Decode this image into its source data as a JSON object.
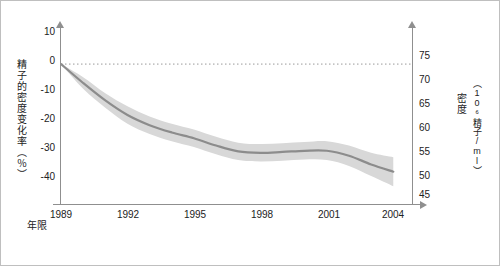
{
  "chart_data": {
    "type": "line",
    "title": "",
    "xlabel": "年限",
    "ylabel_left": "精子的密度变化率（％）",
    "ylabel_right": "密度",
    "ylabel_right_unit": "（10⁶精子/ml）",
    "x": [
      1989,
      1990,
      1991,
      1992,
      1993,
      1994,
      1995,
      1996,
      1997,
      1998,
      1999,
      2000,
      2001,
      2002,
      2003,
      2004
    ],
    "xticks": [
      "1989",
      "1992",
      "1995",
      "1998",
      "2001",
      "2004"
    ],
    "xlim": [
      1989,
      2004.8
    ],
    "yticks_left": [
      "10",
      "0",
      "-10",
      "-20",
      "-30",
      "-40"
    ],
    "ylim_left": [
      -45,
      10
    ],
    "yticks_right": [
      "75",
      "70",
      "65",
      "60",
      "55",
      "50",
      "45"
    ],
    "ylim_right": [
      43.5,
      76.5
    ],
    "series": [
      {
        "name": "精子密度变化率",
        "values": [
          0,
          -6.5,
          -12.5,
          -17.5,
          -21.0,
          -23.5,
          -25.5,
          -28.0,
          -30.0,
          -30.5,
          -30.2,
          -29.8,
          -29.8,
          -31.5,
          -34.5,
          -37.0
        ],
        "band_upper": [
          0,
          -4.5,
          -10.0,
          -14.5,
          -18.0,
          -20.5,
          -22.5,
          -25.0,
          -27.0,
          -27.5,
          -27.2,
          -26.8,
          -26.5,
          -28.0,
          -30.5,
          -32.0
        ],
        "band_lower": [
          0,
          -8.5,
          -15.0,
          -20.5,
          -24.0,
          -26.5,
          -28.5,
          -31.0,
          -33.0,
          -33.5,
          -33.2,
          -32.8,
          -33.0,
          -35.0,
          -38.5,
          -42.0
        ],
        "line_color": "#8c8c8c",
        "band_color": "#d8d8d8"
      }
    ],
    "reference_line": {
      "y": 0,
      "style": "dotted",
      "color": "#9a9a9a"
    },
    "grid": false,
    "legend": "none"
  },
  "axis": {
    "left_ticks": [
      {
        "label": "10",
        "top": 30
      },
      {
        "label": "0",
        "top": 59
      },
      {
        "label": "-10",
        "top": 88
      },
      {
        "label": "-20",
        "top": 117
      },
      {
        "label": "-30",
        "top": 146
      },
      {
        "label": "-40",
        "top": 175
      }
    ],
    "right_ticks": [
      {
        "label": "75",
        "top": 54
      },
      {
        "label": "70",
        "top": 78
      },
      {
        "label": "65",
        "top": 102
      },
      {
        "label": "60",
        "top": 126
      },
      {
        "label": "55",
        "top": 150
      },
      {
        "label": "50",
        "top": 174
      },
      {
        "label": "45",
        "top": 191
      }
    ],
    "x_ticks": [
      {
        "label": "1989",
        "left": 37
      },
      {
        "label": "1992",
        "left": 103
      },
      {
        "label": "1995",
        "left": 170
      },
      {
        "label": "1998",
        "left": 237
      },
      {
        "label": "2001",
        "left": 304
      },
      {
        "label": "2004",
        "left": 368
      }
    ]
  }
}
